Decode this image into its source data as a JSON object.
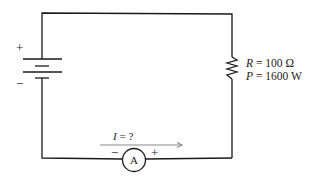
{
  "diagram": {
    "type": "circuit",
    "battery": {
      "plus_label": "+",
      "minus_label": "−"
    },
    "resistor": {
      "r_symbol": "R",
      "r_value": "= 100 Ω",
      "p_symbol": "P",
      "p_value": "= 1600 W"
    },
    "current": {
      "symbol": "I",
      "value": "= ?"
    },
    "ammeter": {
      "label": "A",
      "minus_label": "−",
      "plus_label": "+"
    },
    "colors": {
      "wire": "#1a1a1a",
      "arrow": "#8a8a8a"
    }
  }
}
